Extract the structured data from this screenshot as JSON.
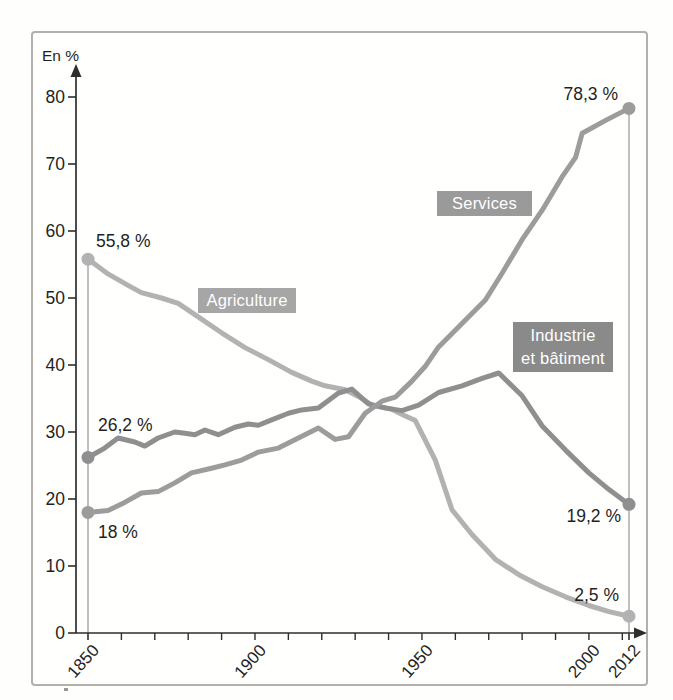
{
  "figure": {
    "border_color": "#b3b0ab",
    "background": "#fffffe"
  },
  "chart_data": {
    "type": "line",
    "title": "",
    "xlabel": "",
    "ylabel": "En %",
    "xlim": [
      1850,
      2012
    ],
    "ylim": [
      0,
      80
    ],
    "grid": false,
    "legend_position": "inline-boxes-on-plot",
    "axis_color": "#2e2e2e",
    "text_color": "#1f1f1f",
    "marker_line_color": "#9e9e9e",
    "y_ticks": [
      0,
      10,
      20,
      30,
      40,
      50,
      60,
      70,
      80
    ],
    "x_minor_tick_years": [
      1850,
      1860,
      1870,
      1880,
      1890,
      1900,
      1910,
      1920,
      1930,
      1940,
      1950,
      1960,
      1970,
      1980,
      1990,
      2000,
      2010,
      2012
    ],
    "x_tick_labels": [
      {
        "year": 1850,
        "label": "1850"
      },
      {
        "year": 1900,
        "label": "1900"
      },
      {
        "year": 1950,
        "label": "1950"
      },
      {
        "year": 2000,
        "label": "2000"
      },
      {
        "year": 2012,
        "label": "2012"
      }
    ],
    "markers": [
      {
        "year": 1850,
        "top_value": 55.8
      },
      {
        "year": 2012,
        "top_value": 78.3
      }
    ],
    "series": [
      {
        "id": "agriculture",
        "label": "Agriculture",
        "color": "#b2b2b2",
        "box_bg": "#a6a6a6",
        "box_text_color": "#ffffff",
        "annotations": {
          "start": "55,8 %",
          "end": "2,5 %"
        },
        "start_value": 55.8,
        "end_value": 2.5,
        "points": [
          [
            1850,
            55.8
          ],
          [
            1856,
            53.6
          ],
          [
            1862,
            51.9
          ],
          [
            1866,
            50.8
          ],
          [
            1872,
            50.0
          ],
          [
            1877,
            49.2
          ],
          [
            1883,
            47.2
          ],
          [
            1890,
            44.8
          ],
          [
            1897,
            42.6
          ],
          [
            1904,
            40.8
          ],
          [
            1911,
            38.9
          ],
          [
            1917,
            37.6
          ],
          [
            1921,
            36.9
          ],
          [
            1927,
            36.3
          ],
          [
            1931,
            35.3
          ],
          [
            1935,
            34.0
          ],
          [
            1941,
            33.4
          ],
          [
            1945,
            32.4
          ],
          [
            1948,
            31.7
          ],
          [
            1954,
            25.8
          ],
          [
            1959,
            18.4
          ],
          [
            1965,
            14.7
          ],
          [
            1972,
            11.0
          ],
          [
            1979,
            8.7
          ],
          [
            1986,
            6.9
          ],
          [
            1993,
            5.4
          ],
          [
            2000,
            4.1
          ],
          [
            2006,
            3.2
          ],
          [
            2012,
            2.5
          ]
        ]
      },
      {
        "id": "industrie",
        "label": "Industrie et bâtiment",
        "label_line1": "Industrie",
        "label_line2": "et bâtiment",
        "color": "#8f8f8f",
        "box_bg": "#8a8a8a",
        "box_text_color": "#ffffff",
        "annotations": {
          "start": "26,2 %",
          "end": "19,2 %"
        },
        "start_value": 26.2,
        "end_value": 19.2,
        "points": [
          [
            1850,
            26.2
          ],
          [
            1855,
            27.6
          ],
          [
            1859,
            29.1
          ],
          [
            1864,
            28.5
          ],
          [
            1867,
            27.9
          ],
          [
            1871,
            29.1
          ],
          [
            1876,
            30.0
          ],
          [
            1879,
            29.8
          ],
          [
            1882,
            29.6
          ],
          [
            1885,
            30.3
          ],
          [
            1889,
            29.6
          ],
          [
            1894,
            30.7
          ],
          [
            1898,
            31.2
          ],
          [
            1901,
            31.0
          ],
          [
            1905,
            31.8
          ],
          [
            1910,
            32.8
          ],
          [
            1914,
            33.3
          ],
          [
            1919,
            33.6
          ],
          [
            1925,
            35.8
          ],
          [
            1929,
            36.4
          ],
          [
            1934,
            34.2
          ],
          [
            1939,
            33.6
          ],
          [
            1944,
            33.2
          ],
          [
            1949,
            34.0
          ],
          [
            1955,
            35.9
          ],
          [
            1962,
            36.9
          ],
          [
            1968,
            38.0
          ],
          [
            1973,
            38.8
          ],
          [
            1980,
            35.4
          ],
          [
            1986,
            30.9
          ],
          [
            1993,
            27.3
          ],
          [
            2000,
            23.9
          ],
          [
            2006,
            21.4
          ],
          [
            2012,
            19.2
          ]
        ]
      },
      {
        "id": "services",
        "label": "Services",
        "color": "#9c9c9c",
        "box_bg": "#9a9a9a",
        "box_text_color": "#ffffff",
        "annotations": {
          "start": "18 %",
          "end": "78,3 %"
        },
        "start_value": 18.0,
        "end_value": 78.3,
        "points": [
          [
            1850,
            18.0
          ],
          [
            1856,
            18.3
          ],
          [
            1861,
            19.5
          ],
          [
            1866,
            20.9
          ],
          [
            1871,
            21.1
          ],
          [
            1876,
            22.4
          ],
          [
            1881,
            23.9
          ],
          [
            1887,
            24.6
          ],
          [
            1891,
            25.1
          ],
          [
            1896,
            25.8
          ],
          [
            1901,
            27.0
          ],
          [
            1907,
            27.6
          ],
          [
            1913,
            29.1
          ],
          [
            1919,
            30.6
          ],
          [
            1924,
            28.9
          ],
          [
            1928,
            29.3
          ],
          [
            1933,
            32.8
          ],
          [
            1938,
            34.6
          ],
          [
            1942,
            35.2
          ],
          [
            1947,
            37.6
          ],
          [
            1951,
            39.8
          ],
          [
            1955,
            42.7
          ],
          [
            1962,
            46.2
          ],
          [
            1969,
            49.7
          ],
          [
            1974,
            53.7
          ],
          [
            1980,
            58.7
          ],
          [
            1986,
            63.1
          ],
          [
            1992,
            68.1
          ],
          [
            1996,
            71.0
          ],
          [
            1998,
            74.6
          ],
          [
            2005,
            76.5
          ],
          [
            2012,
            78.3
          ]
        ]
      }
    ]
  }
}
